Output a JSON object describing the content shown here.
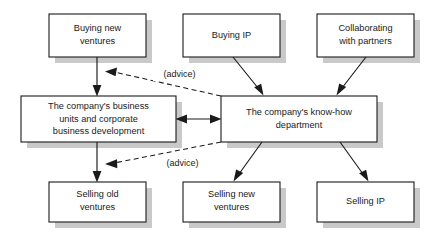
{
  "diagram": {
    "canvas": {
      "width": 437,
      "height": 242,
      "background": "#ffffff"
    },
    "style": {
      "box_fill": "#ffffff",
      "box_stroke": "#1a1a1a",
      "shadow_color": "#c9c9c9",
      "text_color": "#1a1a1a"
    },
    "nodes": [
      {
        "id": "buying-new-ventures",
        "lines": [
          "Buying new",
          "ventures"
        ],
        "x": 49,
        "y": 14,
        "w": 97,
        "h": 43
      },
      {
        "id": "buying-ip",
        "lines": [
          "Buying IP"
        ],
        "x": 183,
        "y": 14,
        "w": 97,
        "h": 43
      },
      {
        "id": "collaborating-with-partners",
        "lines": [
          "Collaborating",
          "with partners"
        ],
        "x": 317,
        "y": 14,
        "w": 97,
        "h": 43
      },
      {
        "id": "business-units",
        "lines": [
          "The company's business",
          "units and corporate",
          "business development"
        ],
        "x": 21,
        "y": 96,
        "w": 155,
        "h": 46
      },
      {
        "id": "know-how-department",
        "lines": [
          "The company's know-how",
          "department"
        ],
        "x": 221,
        "y": 96,
        "w": 156,
        "h": 46
      },
      {
        "id": "selling-old-ventures",
        "lines": [
          "Selling old",
          "ventures"
        ],
        "x": 49,
        "y": 182,
        "w": 97,
        "h": 40
      },
      {
        "id": "selling-new-ventures",
        "lines": [
          "Selling new",
          "ventures"
        ],
        "x": 183,
        "y": 182,
        "w": 97,
        "h": 40
      },
      {
        "id": "selling-ip",
        "lines": [
          "Selling IP"
        ],
        "x": 317,
        "y": 182,
        "w": 97,
        "h": 40
      }
    ],
    "edges": [
      {
        "id": "buying-new-ventures-to-business-units",
        "from": "buying-new-ventures",
        "to": "business-units",
        "style": "solid",
        "label": ""
      },
      {
        "id": "buying-ip-to-know-how",
        "from": "buying-ip",
        "to": "know-how-department",
        "style": "solid",
        "label": ""
      },
      {
        "id": "collaborating-to-know-how",
        "from": "collaborating-with-partners",
        "to": "know-how-department",
        "style": "solid",
        "label": ""
      },
      {
        "id": "business-units-to-selling-old",
        "from": "business-units",
        "to": "selling-old-ventures",
        "style": "solid",
        "label": ""
      },
      {
        "id": "know-how-to-selling-new",
        "from": "know-how-department",
        "to": "selling-new-ventures",
        "style": "solid",
        "label": ""
      },
      {
        "id": "know-how-to-selling-ip",
        "from": "know-how-department",
        "to": "selling-ip",
        "style": "solid",
        "label": ""
      },
      {
        "id": "business-units-know-how-bidirectional",
        "from": "business-units",
        "to": "know-how-department",
        "style": "solid-bidirectional",
        "label": ""
      },
      {
        "id": "advice-upper",
        "from": "know-how-department",
        "to": "buying-new-ventures-arrow",
        "style": "dashed",
        "label": "(advice)"
      },
      {
        "id": "advice-lower",
        "from": "know-how-department",
        "to": "selling-old-ventures-arrow",
        "style": "dashed",
        "label": "(advice)"
      }
    ],
    "labels": {
      "advice_upper": "(advice)",
      "advice_lower": "(advice)"
    }
  }
}
